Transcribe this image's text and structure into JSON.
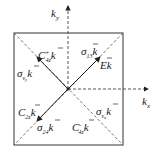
{
  "diagram": {
    "type": "brillouin-zone-symmetry",
    "axes": {
      "kx": {
        "label": "k",
        "sub": "x"
      },
      "ky": {
        "label": "k",
        "sub": "y"
      }
    },
    "labels": [
      {
        "id": "c4z-plus",
        "base": "C",
        "sup": "+",
        "sub": "4z",
        "vec": "k"
      },
      {
        "id": "sigma-13",
        "base": "σ",
        "sub": "13",
        "vec": "k"
      },
      {
        "id": "E",
        "base": "E",
        "vec": "k"
      },
      {
        "id": "sigma-vy",
        "base": "σ",
        "sub": "v_y",
        "vec": "k"
      },
      {
        "id": "c2z",
        "base": "C",
        "sub": "2z",
        "vec": "k"
      },
      {
        "id": "sigma-24",
        "base": "σ",
        "sub": "24",
        "vec": "k"
      },
      {
        "id": "c4z-minus",
        "base": "C",
        "sup": "-",
        "sub": "4z",
        "vec": "k"
      },
      {
        "id": "sigma-vx",
        "base": "σ",
        "sub": "v_x",
        "vec": "k"
      }
    ],
    "colors": {
      "line": "#222222",
      "dash": "#555555"
    }
  }
}
